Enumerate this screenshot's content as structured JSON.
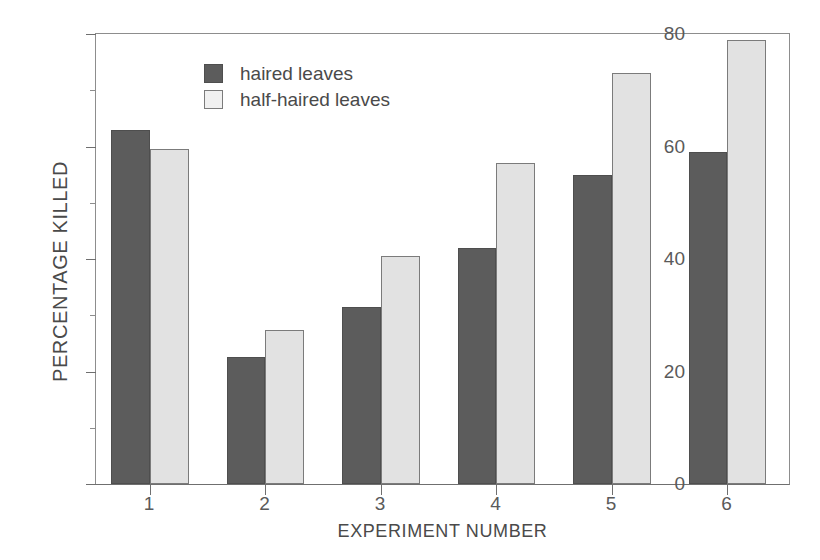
{
  "chart_data": {
    "type": "bar",
    "title": "",
    "xlabel": "EXPERIMENT NUMBER",
    "ylabel": "PERCENTAGE KILLED",
    "categories": [
      "1",
      "2",
      "3",
      "4",
      "5",
      "6"
    ],
    "series": [
      {
        "name": "haired leaves",
        "color": "#5c5c5c",
        "values": [
          63,
          22.5,
          31.5,
          42,
          55,
          59
        ]
      },
      {
        "name": "half-haired leaves",
        "color": "#e2e2e2",
        "values": [
          59.5,
          27.3,
          40.5,
          57,
          73,
          79
        ]
      }
    ],
    "ylim": [
      0,
      80
    ],
    "y_major_ticks": [
      0,
      20,
      40,
      60,
      80
    ],
    "y_minor_ticks": [
      10,
      30,
      50,
      70
    ],
    "y_tick_labels": [
      "0",
      "20",
      "40",
      "60",
      "80"
    ],
    "grid": false,
    "legend_position": "top-center"
  },
  "legend": {
    "entries": [
      {
        "label": "haired leaves",
        "swatch": "dark-gray-square"
      },
      {
        "label": "half-haired leaves",
        "swatch": "light-gray-square"
      }
    ]
  }
}
